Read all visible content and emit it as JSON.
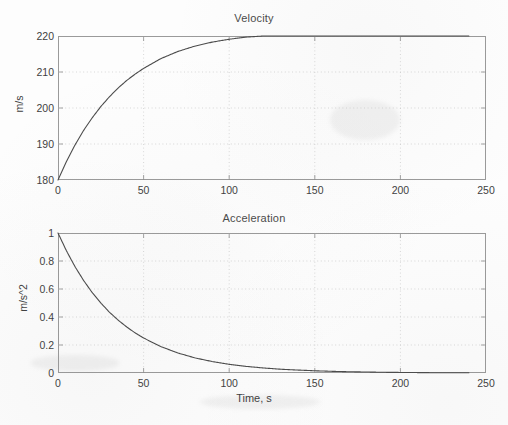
{
  "figure": {
    "background_color": "#fdfdfd",
    "axis_color": "#9a9a9a",
    "grid_color": "#c9c9c9",
    "curve_color": "#4b4b4b"
  },
  "chart_data": [
    {
      "type": "line",
      "title": "Velocity",
      "xlabel": "",
      "ylabel": "m/s",
      "xlim": [
        0,
        250
      ],
      "ylim": [
        180,
        220
      ],
      "grid": true,
      "legend": "none",
      "xticks": [
        0,
        50,
        100,
        150,
        200,
        250
      ],
      "xticklabels": [
        "0",
        "50",
        "100",
        "150",
        "200",
        "250"
      ],
      "yticks": [
        180,
        190,
        200,
        210,
        220
      ],
      "yticklabels": [
        "180",
        "190",
        "200",
        "210",
        "220"
      ],
      "series": [
        {
          "name": "velocity",
          "x": [
            0,
            5,
            10,
            15,
            20,
            25,
            30,
            35,
            40,
            45,
            50,
            60,
            70,
            80,
            90,
            100,
            110,
            120,
            130,
            140,
            150,
            160,
            170,
            180,
            190,
            200,
            210,
            220,
            230,
            240
          ],
          "values": [
            180.0,
            185.2,
            189.8,
            193.8,
            197.3,
            200.4,
            203.1,
            205.5,
            207.6,
            209.4,
            211.0,
            213.7,
            215.7,
            217.2,
            218.3,
            219.1,
            219.7,
            220.0,
            220.0,
            220.0,
            220.0,
            220.0,
            220.0,
            220.0,
            220.0,
            220.0,
            220.0,
            220.0,
            220.0,
            220.0
          ]
        }
      ]
    },
    {
      "type": "line",
      "title": "Acceleration",
      "xlabel": "Time, s",
      "ylabel": "m/s^2",
      "xlim": [
        0,
        250
      ],
      "ylim": [
        0,
        1
      ],
      "grid": true,
      "legend": "none",
      "xticks": [
        0,
        50,
        100,
        150,
        200,
        250
      ],
      "xticklabels": [
        "0",
        "50",
        "100",
        "150",
        "200",
        "250"
      ],
      "yticks": [
        0,
        0.2,
        0.4,
        0.6,
        0.8,
        1
      ],
      "yticklabels": [
        "0",
        "0.2",
        "0.4",
        "0.6",
        "0.8",
        "1"
      ],
      "series": [
        {
          "name": "acceleration",
          "x": [
            0,
            5,
            10,
            15,
            20,
            25,
            30,
            35,
            40,
            45,
            50,
            60,
            70,
            80,
            90,
            100,
            110,
            120,
            130,
            140,
            150,
            160,
            170,
            180,
            190,
            200,
            210,
            220,
            230,
            240
          ],
          "values": [
            1.0,
            0.871,
            0.758,
            0.66,
            0.574,
            0.5,
            0.435,
            0.379,
            0.33,
            0.287,
            0.25,
            0.189,
            0.143,
            0.108,
            0.082,
            0.062,
            0.047,
            0.036,
            0.027,
            0.021,
            0.016,
            0.012,
            0.009,
            0.007,
            0.005,
            0.004,
            0.003,
            0.002,
            0.0017,
            0.0013
          ]
        }
      ]
    }
  ]
}
